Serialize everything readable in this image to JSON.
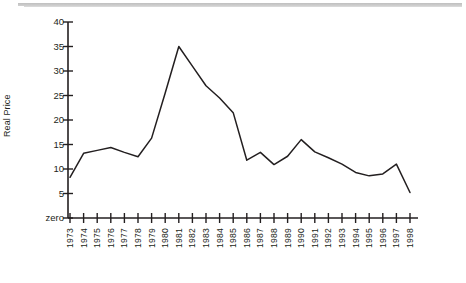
{
  "chart_data": {
    "type": "line",
    "title": "",
    "xlabel": "",
    "ylabel": "Real Price",
    "x": [
      1973,
      1974,
      1975,
      1976,
      1977,
      1978,
      1979,
      1980,
      1981,
      1982,
      1983,
      1984,
      1985,
      1986,
      1987,
      1988,
      1989,
      1990,
      1991,
      1992,
      1993,
      1994,
      1995,
      1996,
      1997,
      1998
    ],
    "xtick_labels": [
      "1973",
      "1974",
      "1975",
      "1976",
      "1977",
      "1978",
      "1979",
      "1980",
      "1981",
      "1982",
      "1983",
      "1984",
      "1985",
      "1986",
      "1987",
      "1988",
      "1989",
      "1990",
      "1991",
      "1992",
      "1993",
      "1994",
      "1995",
      "1996",
      "1997",
      "1998"
    ],
    "values": [
      8.3,
      13.2,
      13.8,
      14.4,
      13.4,
      12.5,
      16.3,
      25.5,
      35.0,
      31.0,
      27.0,
      24.5,
      21.5,
      11.8,
      13.4,
      10.9,
      12.6,
      16.0,
      13.5,
      12.3,
      11.0,
      9.3,
      8.6,
      9.0,
      11.0,
      5.2
    ],
    "ytick_labels": [
      "40",
      "35",
      "30",
      "25",
      "20",
      "15",
      "10",
      "5",
      "zero"
    ],
    "ytick_values": [
      40,
      35,
      30,
      25,
      20,
      15,
      10,
      5,
      0
    ],
    "ylim": [
      0,
      40
    ],
    "grid": false,
    "legend": false,
    "legend_position": "none",
    "series": [
      {
        "name": "Real Price",
        "values": [
          8.3,
          13.2,
          13.8,
          14.4,
          13.4,
          12.5,
          16.3,
          25.5,
          35.0,
          31.0,
          27.0,
          24.5,
          21.5,
          11.8,
          13.4,
          10.9,
          12.6,
          16.0,
          13.5,
          12.3,
          11.0,
          9.3,
          8.6,
          9.0,
          11.0,
          5.2
        ],
        "color": "#231f20"
      }
    ],
    "colors": {
      "line": "#231f20",
      "axis": "#231f20",
      "text": "#231f20",
      "background": "#ffffff"
    }
  }
}
